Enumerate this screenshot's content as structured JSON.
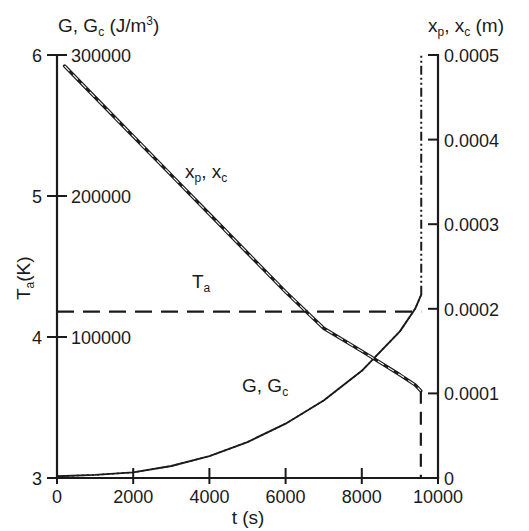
{
  "chart_data": {
    "type": "line",
    "title": "",
    "xlabel": "t (s)",
    "xlim": [
      0,
      10000
    ],
    "xticks": [
      0,
      2000,
      4000,
      6000,
      8000,
      10000
    ],
    "xticklabels": [
      "0",
      "2000",
      "4000",
      "6000",
      "8000",
      "10000"
    ],
    "axes": {
      "left_inner": {
        "label": "Ta(K)",
        "label_main": "T",
        "label_sub": "a",
        "label_unit": "(K)",
        "lim": [
          3,
          6
        ],
        "ticks": [
          3,
          4,
          5,
          6
        ],
        "ticklabels": [
          "3",
          "4",
          "5",
          "6"
        ]
      },
      "left_outer": {
        "label": "G, Gc (J/m3)",
        "label_main": "G, G",
        "label_sub": "c",
        "label_unit": "(J/m",
        "label_sup": "3",
        "label_close": ")",
        "lim": [
          0,
          300000
        ],
        "ticks": [
          100000,
          200000,
          300000
        ],
        "ticklabels": [
          "100000",
          "200000",
          "300000"
        ]
      },
      "right": {
        "label": "xp, xc (m)",
        "label_main": "x",
        "label_sub1": "p",
        "label_mid": ", x",
        "label_sub2": "c",
        "label_unit": "(m)",
        "lim": [
          0,
          0.0005
        ],
        "ticks": [
          0,
          0.0001,
          0.0002,
          0.0003,
          0.0004,
          0.0005
        ],
        "ticklabels": [
          "0",
          "0.0001",
          "0.0002",
          "0.0003",
          "0.0004",
          "0.0005"
        ]
      }
    },
    "grid": false,
    "legend": "inline-annotations",
    "series": [
      {
        "name": "xp, xc",
        "label": "xp, xc",
        "label_main": "x",
        "label_sub1": "p",
        "label_mid": ", x",
        "label_sub2": "c",
        "style": "solid-thick-with-dashed-overlay",
        "axis": "right",
        "label_x": 185,
        "label_y": 178,
        "points": [
          [
            200,
            0.000487
          ],
          [
            1000,
            0.00045
          ],
          [
            2000,
            0.000404
          ],
          [
            3000,
            0.000358
          ],
          [
            4000,
            0.000312
          ],
          [
            5000,
            0.000266
          ],
          [
            6000,
            0.00022
          ],
          [
            7000,
            0.000177
          ],
          [
            8000,
            0.00015
          ],
          [
            9000,
            0.000122
          ],
          [
            9400,
            0.00011
          ],
          [
            9550,
            0.000103
          ]
        ],
        "drop_segment": {
          "x": 9550,
          "y_from": 0.000103,
          "y_to": 0.0,
          "style": "dashed"
        }
      },
      {
        "name": "G, Gc",
        "label": "G, Gc",
        "label_main": "G, G",
        "label_sub": "c",
        "style": "solid-thin-with-dotted-overlay",
        "axis": "left_outer",
        "label_x": 242,
        "label_y": 392,
        "points": [
          [
            0,
            1200
          ],
          [
            1000,
            2200
          ],
          [
            2000,
            4000
          ],
          [
            3000,
            8500
          ],
          [
            4000,
            15500
          ],
          [
            5000,
            25500
          ],
          [
            6000,
            38500
          ],
          [
            7000,
            55000
          ],
          [
            8000,
            76000
          ],
          [
            9000,
            104000
          ],
          [
            9400,
            120000
          ],
          [
            9560,
            130000
          ]
        ],
        "rise_segment": {
          "x": 9560,
          "y_from": 130000,
          "y_to": 300000,
          "style": "dash-dot-dot"
        }
      },
      {
        "name": "Ta",
        "label": "Ta",
        "label_main": "T",
        "label_sub": "a",
        "style": "dashed",
        "axis": "left_inner",
        "value": 4.18,
        "label_x": 192,
        "label_y": 288,
        "x_start": 0,
        "x_end": 9560
      }
    ],
    "annotations": [
      {
        "text": "xp, xc",
        "x": 185,
        "y": 178
      },
      {
        "text": "G, Gc",
        "x": 242,
        "y": 392
      },
      {
        "text": "Ta",
        "x": 192,
        "y": 288
      }
    ]
  }
}
